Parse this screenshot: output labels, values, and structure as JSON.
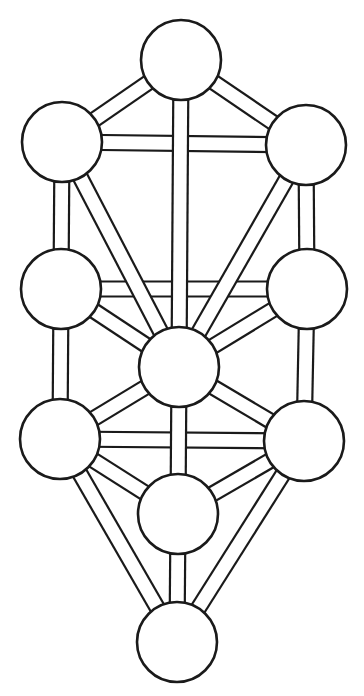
{
  "diagram": {
    "stroke_color": "#1a1a1a",
    "background": "#ffffff",
    "channel_width": 15,
    "node_radius": 40,
    "nodes": [
      {
        "id": "n1",
        "label": "top",
        "x": 181,
        "y": 60
      },
      {
        "id": "n2",
        "label": "upper-left",
        "x": 62,
        "y": 142
      },
      {
        "id": "n3",
        "label": "upper-right",
        "x": 306,
        "y": 145
      },
      {
        "id": "n4",
        "label": "middle-left",
        "x": 61,
        "y": 289
      },
      {
        "id": "n5",
        "label": "middle-right",
        "x": 307,
        "y": 289
      },
      {
        "id": "n6",
        "label": "center",
        "x": 179,
        "y": 367
      },
      {
        "id": "n7",
        "label": "lower-left",
        "x": 60,
        "y": 439
      },
      {
        "id": "n8",
        "label": "lower-right",
        "x": 304,
        "y": 441
      },
      {
        "id": "n9",
        "label": "lower-center",
        "x": 178,
        "y": 514
      },
      {
        "id": "n10",
        "label": "bottom",
        "x": 177,
        "y": 642
      }
    ],
    "paths_bottom_layer": [
      [
        "n2",
        "n3"
      ],
      [
        "n4",
        "n5"
      ],
      [
        "n7",
        "n8"
      ]
    ],
    "paths_top_layer": [
      [
        "n1",
        "n2"
      ],
      [
        "n1",
        "n3"
      ],
      [
        "n1",
        "n6"
      ],
      [
        "n2",
        "n4"
      ],
      [
        "n3",
        "n5"
      ],
      [
        "n2",
        "n6"
      ],
      [
        "n3",
        "n6"
      ],
      [
        "n4",
        "n6"
      ],
      [
        "n5",
        "n6"
      ],
      [
        "n4",
        "n7"
      ],
      [
        "n5",
        "n8"
      ],
      [
        "n6",
        "n7"
      ],
      [
        "n6",
        "n8"
      ],
      [
        "n6",
        "n9"
      ],
      [
        "n7",
        "n9"
      ],
      [
        "n8",
        "n9"
      ],
      [
        "n7",
        "n10"
      ],
      [
        "n8",
        "n10"
      ],
      [
        "n9",
        "n10"
      ]
    ]
  },
  "header": {
    "cut_off_text": ""
  }
}
